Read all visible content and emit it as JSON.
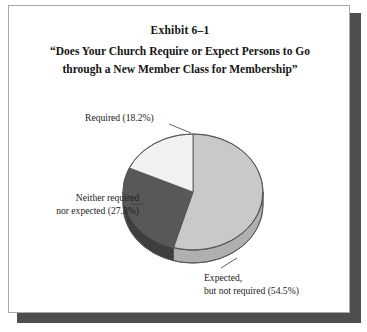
{
  "figure": {
    "exhibit_number": "Exhibit 6–1",
    "title_line1": "“Does Your Church Require or Expect Persons to Go",
    "title_line2": "through a New Member Class for Membership”"
  },
  "labels": {
    "required": "Required (18.2%)",
    "neither_line1": "Neither required",
    "neither_line2": "nor expected (27.3%)",
    "expected_line1": "Expected,",
    "expected_line2": "but not required (54.5%)"
  },
  "colors": {
    "slice_required": "#f2f2f2",
    "slice_neither": "#585858",
    "slice_expected": "#c9c9c9",
    "slice_required_side": "#d6d6d6",
    "slice_neither_side": "#3e3e3e",
    "slice_expected_side": "#b0b0b0",
    "outline": "#555555",
    "frame_border": "#a9a9a9",
    "frame_shadow": "#4e4e4e",
    "text": "#161616",
    "background": "#ffffff"
  },
  "chart_data": {
    "type": "pie",
    "title": "“Does Your Church Require or Expect Persons to Go through a New Member Class for Membership”",
    "subtitle": "Exhibit 6–1",
    "three_d": true,
    "start_angle_deg": 0,
    "direction": "clockwise",
    "legend": "none",
    "grid": false,
    "categories": [
      "Expected, but not required",
      "Neither required nor expected",
      "Required"
    ],
    "values": [
      54.5,
      27.3,
      18.2
    ],
    "value_unit": "%",
    "slices": [
      {
        "label": "Expected, but not required",
        "value": 54.5,
        "angle_deg": 196.2,
        "color": "#c9c9c9",
        "label_text": "Expected,\nbut not required (54.5%)"
      },
      {
        "label": "Neither required nor expected",
        "value": 27.3,
        "angle_deg": 98.3,
        "color": "#585858",
        "label_text": "Neither required\nnor expected (27.3%)"
      },
      {
        "label": "Required",
        "value": 18.2,
        "angle_deg": 65.5,
        "color": "#f2f2f2",
        "label_text": "Required (18.2%)"
      }
    ]
  }
}
